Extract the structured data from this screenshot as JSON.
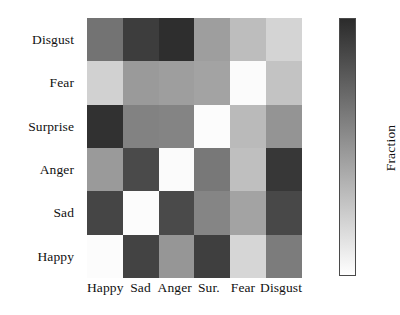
{
  "chart_data": {
    "type": "heatmap",
    "title": "",
    "xlabel": "",
    "ylabel": "",
    "colorbar_label": "Fraction",
    "colormap": "gray_reversed",
    "colormap_note": "darker = higher fraction, white = 0",
    "grid": false,
    "legend_position": "right-colorbar",
    "x_categories": [
      "Happy",
      "Sad",
      "Anger",
      "Sur.",
      "Fear",
      "Disgust"
    ],
    "y_categories_top_to_bottom": [
      "Disgust",
      "Fear",
      "Surprise",
      "Anger",
      "Sad",
      "Happy"
    ],
    "zlim": [
      0.0,
      1.0
    ],
    "rows": [
      {
        "label": "Disgust",
        "values": [
          0.55,
          0.78,
          0.86,
          0.4,
          0.26,
          0.16
        ],
        "colors": [
          "#737373",
          "#3d3d3d",
          "#2e2e2e",
          "#9e9e9e",
          "#bdbdbd",
          "#d4d4d4"
        ]
      },
      {
        "label": "Fear",
        "values": [
          0.18,
          0.42,
          0.4,
          0.38,
          0.03,
          0.24
        ],
        "colors": [
          "#d1d1d1",
          "#9a9a9a",
          "#9e9e9e",
          "#a3a3a3",
          "#fbfbfb",
          "#c3c3c3"
        ]
      },
      {
        "label": "Surprise",
        "values": [
          0.84,
          0.5,
          0.5,
          0.02,
          0.27,
          0.44
        ],
        "colors": [
          "#313131",
          "#828282",
          "#848484",
          "#fcfcfc",
          "#bababa",
          "#949494"
        ]
      },
      {
        "label": "Anger",
        "values": [
          0.42,
          0.72,
          0.03,
          0.53,
          0.25,
          0.82
        ],
        "colors": [
          "#9a9a9a",
          "#4a4a4a",
          "#fbfbfb",
          "#787878",
          "#bfbfbf",
          "#373737"
        ]
      },
      {
        "label": "Sad",
        "values": [
          0.74,
          0.02,
          0.72,
          0.49,
          0.38,
          0.73
        ],
        "colors": [
          "#454545",
          "#fcfcfc",
          "#4a4a4a",
          "#858585",
          "#a3a3a3",
          "#484848"
        ]
      },
      {
        "label": "Happy",
        "values": [
          0.02,
          0.75,
          0.43,
          0.79,
          0.16,
          0.52
        ]
      }
    ],
    "matrix": [
      [
        0.55,
        0.78,
        0.86,
        0.4,
        0.26,
        0.16
      ],
      [
        0.18,
        0.42,
        0.4,
        0.38,
        0.03,
        0.24
      ],
      [
        0.84,
        0.5,
        0.5,
        0.02,
        0.27,
        0.44
      ],
      [
        0.42,
        0.72,
        0.03,
        0.53,
        0.25,
        0.82
      ],
      [
        0.74,
        0.02,
        0.72,
        0.49,
        0.38,
        0.73
      ],
      [
        0.02,
        0.75,
        0.43,
        0.79,
        0.16,
        0.52
      ]
    ],
    "cell_colors": [
      [
        "#737373",
        "#3d3d3d",
        "#2e2e2e",
        "#9e9e9e",
        "#bdbdbd",
        "#d4d4d4"
      ],
      [
        "#d1d1d1",
        "#9a9a9a",
        "#9e9e9e",
        "#a3a3a3",
        "#fbfbfb",
        "#c3c3c3"
      ],
      [
        "#313131",
        "#828282",
        "#848484",
        "#fcfcfc",
        "#bababa",
        "#949494"
      ],
      [
        "#9a9a9a",
        "#4a4a4a",
        "#fbfbfb",
        "#787878",
        "#bfbfbf",
        "#373737"
      ],
      [
        "#454545",
        "#fcfcfc",
        "#4a4a4a",
        "#858585",
        "#a3a3a3",
        "#484848"
      ],
      [
        "#fcfcfc",
        "#434343",
        "#969696",
        "#3f3f3f",
        "#d6d6d6",
        "#7c7c7c"
      ]
    ]
  },
  "axes": {
    "x_tick_labels": [
      "Happy",
      "Sad",
      "Anger",
      "Sur.",
      "Fear",
      "Disgust"
    ],
    "y_tick_labels": [
      "Disgust",
      "Fear",
      "Surprise",
      "Anger",
      "Sad",
      "Happy"
    ]
  },
  "colorbar": {
    "label": "Fraction",
    "top_color": "#2b2b2b",
    "bottom_color": "#ffffff",
    "border_color": "#4a4a4a"
  }
}
